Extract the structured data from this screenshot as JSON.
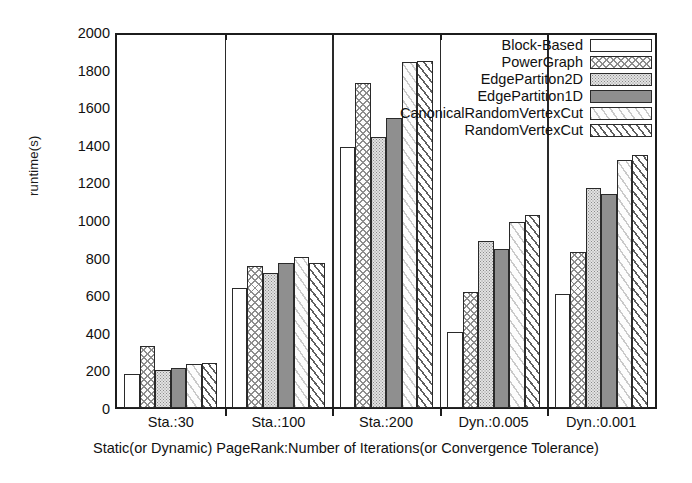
{
  "chart_data": {
    "type": "bar",
    "title": "",
    "xlabel": "Static(or Dynamic) PageRank:Number of Iterations(or Convergence Tolerance)",
    "ylabel": "runtime(s)",
    "ylim": [
      0,
      2000
    ],
    "ytick_step": 200,
    "yticks": [
      0,
      200,
      400,
      600,
      800,
      1000,
      1200,
      1400,
      1600,
      1800,
      2000
    ],
    "grid": false,
    "legend_position": "top-right inside plot",
    "categories": [
      "Sta.:30",
      "Sta.:100",
      "Sta.:200",
      "Dyn.:0.005",
      "Dyn.:0.001"
    ],
    "series": [
      {
        "name": "Block-Based",
        "pattern": "empty",
        "values": [
          185,
          645,
          1400,
          405,
          610
        ]
      },
      {
        "name": "PowerGraph",
        "pattern": "crosshatch",
        "values": [
          335,
          760,
          1745,
          620,
          835
        ]
      },
      {
        "name": "EdgePartiton2D",
        "pattern": "stipple",
        "values": [
          205,
          725,
          1455,
          895,
          1180
        ]
      },
      {
        "name": "EdgePartition1D",
        "pattern": "solid-gray",
        "values": [
          215,
          775,
          1555,
          855,
          1150
        ]
      },
      {
        "name": "CanonicalRandomVertexCut",
        "pattern": "light-diagonal",
        "values": [
          235,
          810,
          1855,
          1000,
          1330
        ]
      },
      {
        "name": "RandomVertexCut",
        "pattern": "dense-diagonal",
        "values": [
          240,
          780,
          1860,
          1035,
          1355
        ]
      }
    ]
  },
  "legend": {
    "items": [
      {
        "label": "Block-Based"
      },
      {
        "label": "PowerGraph"
      },
      {
        "label": "EdgePartiton2D"
      },
      {
        "label": "EdgePartition1D"
      },
      {
        "label": "CanonicalRandomVertexCut"
      },
      {
        "label": "RandomVertexCut"
      }
    ]
  },
  "axes": {
    "y_title": "runtime(s)",
    "x_title": "Static(or Dynamic) PageRank:Number of Iterations(or Convergence Tolerance)",
    "y_tick_labels": [
      "2000",
      "1800",
      "1600",
      "1400",
      "1200",
      "1000",
      "800",
      "600",
      "400",
      "200",
      "0"
    ],
    "x_tick_labels": [
      "Sta.:30",
      "Sta.:100",
      "Sta.:200",
      "Dyn.:0.005",
      "Dyn.:0.001"
    ]
  },
  "colors": {
    "axis": "#1c1c1c",
    "bar_outline": "#2a2a2a",
    "solid_fill": "#8f8f8f",
    "hatch": "#5f5f5f",
    "background": "#ffffff"
  }
}
